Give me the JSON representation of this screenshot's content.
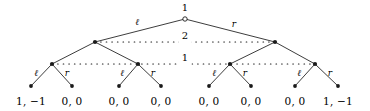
{
  "figure": {
    "type": "extensive-form-game-tree",
    "background": "#ffffff",
    "ink_color": "#1a1a1a",
    "width": 370,
    "height": 111
  },
  "nodes": {
    "root": {
      "id": "root",
      "label": "1",
      "player": "1",
      "style": "hollow",
      "x": 185,
      "y": 19
    },
    "level2": [
      {
        "id": "n2L",
        "style": "filled",
        "x": 95,
        "y": 42
      },
      {
        "id": "n2R",
        "style": "filled",
        "x": 275,
        "y": 42
      }
    ],
    "level3": [
      {
        "id": "n3a",
        "style": "filled",
        "x": 52,
        "y": 64
      },
      {
        "id": "n3b",
        "style": "filled",
        "x": 138,
        "y": 64
      },
      {
        "id": "n3c",
        "style": "filled",
        "x": 230,
        "y": 64
      },
      {
        "id": "n3d",
        "style": "filled",
        "x": 315,
        "y": 64
      }
    ],
    "leaves": [
      {
        "id": "t1",
        "x": 31,
        "y": 86
      },
      {
        "id": "t2",
        "x": 72,
        "y": 86
      },
      {
        "id": "t3",
        "x": 119,
        "y": 86
      },
      {
        "id": "t4",
        "x": 161,
        "y": 86
      },
      {
        "id": "t5",
        "x": 209,
        "y": 86
      },
      {
        "id": "t6",
        "x": 251,
        "y": 86
      },
      {
        "id": "t7",
        "x": 295,
        "y": 86
      },
      {
        "id": "t8",
        "x": 338,
        "y": 86
      }
    ]
  },
  "root_actions": [
    {
      "label": "ℓ",
      "x": 137,
      "y": 22
    },
    {
      "label": "r",
      "x": 234,
      "y": 24
    }
  ],
  "branch_actions": [
    {
      "label": "ℓ",
      "x": 36,
      "y": 73
    },
    {
      "label": "r",
      "x": 67,
      "y": 73
    },
    {
      "label": "ℓ",
      "x": 122,
      "y": 73
    },
    {
      "label": "r",
      "x": 153,
      "y": 73
    },
    {
      "label": "ℓ",
      "x": 214,
      "y": 73
    },
    {
      "label": "r",
      "x": 245,
      "y": 73
    },
    {
      "label": "ℓ",
      "x": 299,
      "y": 73
    },
    {
      "label": "r",
      "x": 330,
      "y": 73
    }
  ],
  "information_sets": [
    {
      "id": "infoset-player-2",
      "player_label": "2",
      "label_x": 185,
      "label_y": 36,
      "y": 42,
      "x_start": 95,
      "x_end": 275
    },
    {
      "id": "infoset-player-1",
      "player_label": "1",
      "label_x": 185,
      "label_y": 58,
      "y": 64,
      "x_start": 52,
      "x_end": 315
    }
  ],
  "payoffs": [
    {
      "id": "payoff-1",
      "text": "1, −1",
      "x": 31,
      "y": 101
    },
    {
      "id": "payoff-2",
      "text": "0, 0",
      "x": 72,
      "y": 101
    },
    {
      "id": "payoff-3",
      "text": "0, 0",
      "x": 119,
      "y": 101
    },
    {
      "id": "payoff-4",
      "text": "0, 0",
      "x": 161,
      "y": 101
    },
    {
      "id": "payoff-5",
      "text": "0, 0",
      "x": 209,
      "y": 101
    },
    {
      "id": "payoff-6",
      "text": "0, 0",
      "x": 251,
      "y": 101
    },
    {
      "id": "payoff-7",
      "text": "0, 0",
      "x": 295,
      "y": 101
    },
    {
      "id": "payoff-8",
      "text": "1, −1",
      "x": 338,
      "y": 101
    }
  ],
  "edges": [
    {
      "from": "root",
      "to": "n2L"
    },
    {
      "from": "root",
      "to": "n2R"
    },
    {
      "from": "n2L",
      "to": "n3a"
    },
    {
      "from": "n2L",
      "to": "n3b"
    },
    {
      "from": "n2R",
      "to": "n3c"
    },
    {
      "from": "n2R",
      "to": "n3d"
    },
    {
      "from": "n3a",
      "to": "t1"
    },
    {
      "from": "n3a",
      "to": "t2"
    },
    {
      "from": "n3b",
      "to": "t3"
    },
    {
      "from": "n3b",
      "to": "t4"
    },
    {
      "from": "n3c",
      "to": "t5"
    },
    {
      "from": "n3c",
      "to": "t6"
    },
    {
      "from": "n3d",
      "to": "t7"
    },
    {
      "from": "n3d",
      "to": "t8"
    }
  ]
}
